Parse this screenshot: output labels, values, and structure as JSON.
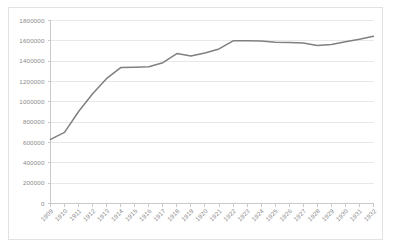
{
  "chart_data": {
    "type": "line",
    "title": "",
    "subtitle": "",
    "xlabel": "",
    "ylabel": "",
    "categories": [
      "1909",
      "1910",
      "1911",
      "1912",
      "1913",
      "1914",
      "1915",
      "1916",
      "1917",
      "1918",
      "1919",
      "1920",
      "1921",
      "1922",
      "1923",
      "1924",
      "1925",
      "1926",
      "1927",
      "1928",
      "1929",
      "1930",
      "1931",
      "1932"
    ],
    "series": [
      {
        "name": "",
        "values": [
          630000,
          700000,
          905000,
          1080000,
          1230000,
          1337000,
          1340000,
          1345000,
          1385000,
          1475000,
          1450000,
          1480000,
          1520000,
          1600000,
          1600000,
          1598000,
          1585000,
          1583000,
          1578000,
          1555000,
          1565000,
          1590000,
          1615000,
          1645000
        ]
      }
    ],
    "ylim": [
      0,
      1800000
    ],
    "ytick_step": 200000,
    "ytick_labels": [
      "0",
      "200000",
      "400000",
      "600000",
      "800000",
      "1000000",
      "1200000",
      "1400000",
      "1600000",
      "1800000"
    ],
    "grid": "horizontal",
    "legend": "none",
    "line_color": "#808080",
    "gridline_color": "#e8e8e8",
    "axis_color": "#c9c9c9",
    "tick_label_color": "#8a8a8a",
    "border_color": "#e2e2e2",
    "xtick_label_rotation": -45
  }
}
